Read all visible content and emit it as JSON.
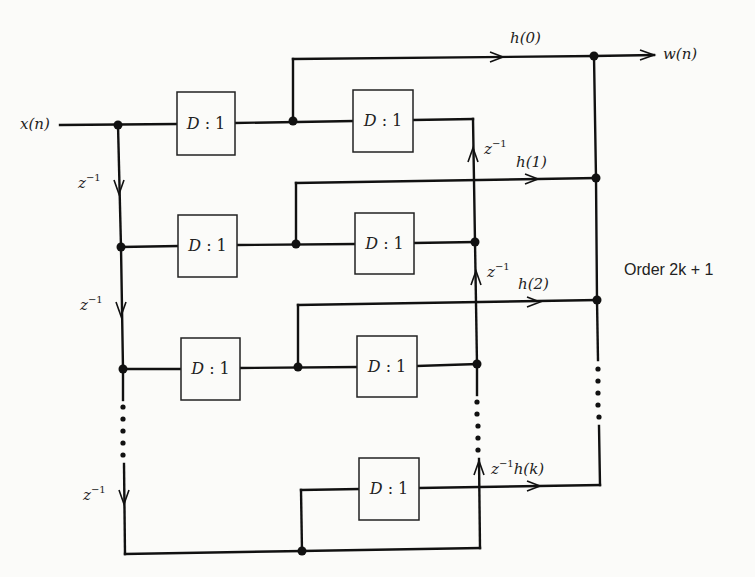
{
  "diagram": {
    "input_label": "x(n)",
    "output_label": "w(n)",
    "order_label": "Order 2k + 1",
    "decimator_label": "D : 1",
    "delay_label": "z",
    "delay_exp": "−1",
    "taps": [
      {
        "id": "h0",
        "label": "h(0)",
        "prefix": ""
      },
      {
        "id": "h1",
        "label": "h(1)",
        "prefix": "z"
      },
      {
        "id": "h2",
        "label": "h(2)",
        "prefix": "z"
      },
      {
        "id": "hk",
        "label": "h(k)",
        "prefix": "z"
      }
    ],
    "rows": [
      {
        "name": "row-1",
        "boxes": 2
      },
      {
        "name": "row-2",
        "boxes": 2
      },
      {
        "name": "row-3",
        "boxes": 2
      },
      {
        "name": "row-k",
        "boxes": 1
      }
    ],
    "left_delays": 3,
    "colors": {
      "line": "#111111",
      "background": "#fbfbf9"
    }
  }
}
